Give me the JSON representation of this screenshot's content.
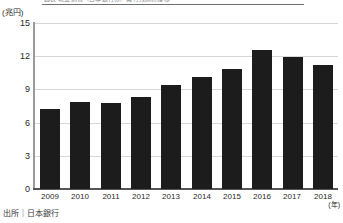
{
  "clipped_caption": "図表 現金通貨（日本銀行券）発行残高の推移",
  "unit_label": "(兆円)",
  "xaxis_unit": "(年)",
  "source_note": "出所｜日本銀行",
  "axis": {
    "y_ticks": [
      "0",
      "3",
      "6",
      "9",
      "12",
      "15"
    ],
    "y_min": 0,
    "y_max": 15,
    "y_step": 3
  },
  "chart_data": {
    "type": "bar",
    "title": "",
    "xlabel": "(年)",
    "ylabel": "(兆円)",
    "ylim": [
      0,
      15
    ],
    "ytick_values": [
      0,
      3,
      6,
      9,
      12,
      15
    ],
    "grid": true,
    "legend": "none",
    "bar_color": "#1c1c1c",
    "categories": [
      "2009",
      "2010",
      "2011",
      "2012",
      "2013",
      "2014",
      "2015",
      "2016",
      "2017",
      "2018"
    ],
    "values": [
      7.2,
      7.9,
      7.8,
      8.3,
      9.4,
      10.1,
      10.8,
      12.6,
      11.9,
      11.2
    ],
    "series": [
      {
        "name": "残高",
        "values": [
          7.2,
          7.9,
          7.8,
          8.3,
          9.4,
          10.1,
          10.8,
          12.6,
          11.9,
          11.2
        ]
      }
    ]
  }
}
